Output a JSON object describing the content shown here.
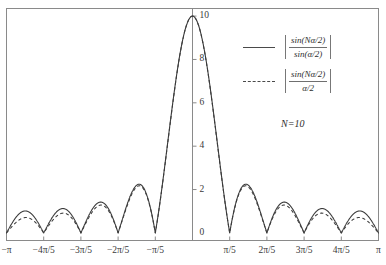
{
  "chart_data": {
    "type": "line",
    "title": "",
    "xlabel": "",
    "ylabel": "",
    "xlim": [
      -3.141592653589793,
      3.141592653589793
    ],
    "ylim": [
      -0.35,
      10.35
    ],
    "grid": false,
    "legend_position": "upper-right",
    "annotations": [
      {
        "text": "N=10",
        "x": 1.6,
        "y": 5.0
      }
    ],
    "parameters": {
      "N": 10
    },
    "x_ticks": [
      {
        "value": -3.141592653589793,
        "label": "−π"
      },
      {
        "value": -2.5132741228718345,
        "label": "−4π/5"
      },
      {
        "value": -1.8849555921538759,
        "label": "−3π/5"
      },
      {
        "value": -1.2566370614359172,
        "label": "−2π/5"
      },
      {
        "value": -0.6283185307179586,
        "label": "−π/5"
      },
      {
        "value": 0.6283185307179586,
        "label": "π/5"
      },
      {
        "value": 1.2566370614359172,
        "label": "2π/5"
      },
      {
        "value": 1.8849555921538759,
        "label": "3π/5"
      },
      {
        "value": 2.5132741228718345,
        "label": "4π/5"
      },
      {
        "value": 3.141592653589793,
        "label": "π"
      }
    ],
    "y_ticks": [
      {
        "value": 0,
        "label": "0"
      },
      {
        "value": 2,
        "label": "2"
      },
      {
        "value": 4,
        "label": "4"
      },
      {
        "value": 6,
        "label": "6"
      },
      {
        "value": 8,
        "label": "8"
      },
      {
        "value": 10,
        "label": "10"
      }
    ],
    "series": [
      {
        "name": "|sin(Nα/2)/sin(α/2)|",
        "style": "solid",
        "color": "#3b3b3b",
        "formula": "abs_sin_ratio",
        "numerator": "sin(Nα/2)",
        "denominator": "sin(α/2)",
        "peak_value": 10,
        "peak_x": 0,
        "side_lobe_peaks": [
          {
            "x": -2.827,
            "y": 1.0
          },
          {
            "x": -2.199,
            "y": 1.06
          },
          {
            "x": -1.571,
            "y": 1.24
          },
          {
            "x": -0.942,
            "y": 1.56
          },
          {
            "x": -0.314,
            "y": 1.93
          },
          {
            "x": 0.314,
            "y": 1.93
          },
          {
            "x": 0.942,
            "y": 1.56
          },
          {
            "x": 1.571,
            "y": 1.24
          },
          {
            "x": 2.199,
            "y": 1.06
          },
          {
            "x": 2.827,
            "y": 1.0
          }
        ],
        "zeros": [
          -2.513,
          -1.885,
          -1.257,
          -0.628,
          0.628,
          1.257,
          1.885,
          2.513
        ]
      },
      {
        "name": "|sin(Nα/2)/(α/2)|",
        "style": "dashed",
        "color": "#3b3b3b",
        "formula": "abs_sinc_ratio",
        "numerator": "sin(Nα/2)",
        "denominator": "α/2",
        "peak_value": 10,
        "peak_x": 0,
        "side_lobe_peaks": [
          {
            "x": -2.827,
            "y": 0.71
          },
          {
            "x": -2.199,
            "y": 0.91
          },
          {
            "x": -1.571,
            "y": 1.27
          },
          {
            "x": -0.942,
            "y": 2.12
          },
          {
            "x": -0.314,
            "y": 6.36
          },
          {
            "x": 0.314,
            "y": 6.36
          },
          {
            "x": 0.942,
            "y": 2.12
          },
          {
            "x": 1.571,
            "y": 1.27
          },
          {
            "x": 2.199,
            "y": 0.91
          },
          {
            "x": 2.827,
            "y": 0.71
          }
        ],
        "zeros": [
          -2.513,
          -1.885,
          -1.257,
          -0.628,
          0.628,
          1.257,
          1.885,
          2.513
        ]
      }
    ]
  },
  "legend": {
    "entries": [
      {
        "style": "solid",
        "numerator": "sin(Nα/2)",
        "denominator": "sin(α/2)"
      },
      {
        "style": "dashed",
        "numerator": "sin(Nα/2)",
        "denominator": "α/2"
      }
    ]
  },
  "annotation": {
    "n_label": "N=10"
  }
}
